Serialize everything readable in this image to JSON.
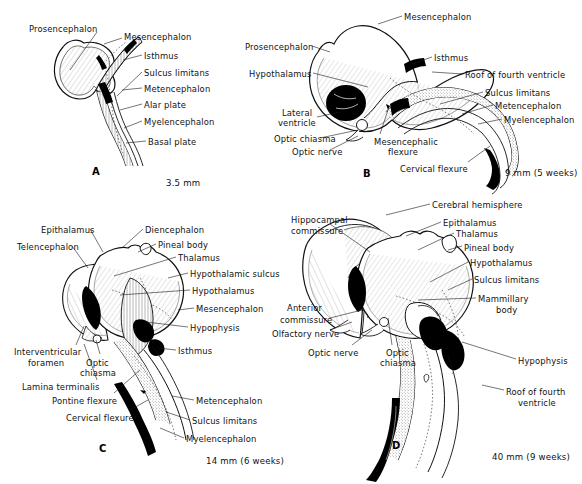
{
  "figure": {
    "background_color": "#ffffff",
    "ink_color": "#101010"
  },
  "panels": [
    {
      "letter": "A",
      "letter_pos": {
        "x": 92,
        "y": 166
      },
      "scale": "3.5 mm",
      "scale_pos": {
        "x": 166,
        "y": 178
      },
      "labels": [
        {
          "text": "Prosencephalon",
          "x": 29,
          "y": 24,
          "anchor": "start",
          "leader": [
            [
              97,
              32
            ],
            [
              70,
              70
            ]
          ]
        },
        {
          "text": "Mesencephalon",
          "x": 124,
          "y": 32,
          "anchor": "start",
          "leader": [
            [
              122,
              38
            ],
            [
              104,
              44
            ]
          ]
        },
        {
          "text": "Isthmus",
          "x": 144,
          "y": 51,
          "anchor": "start",
          "leader": [
            [
              142,
              55
            ],
            [
              123,
              60
            ]
          ]
        },
        {
          "text": "Sulcus limitans",
          "x": 144,
          "y": 68,
          "anchor": "start",
          "leader": [
            [
              142,
              72
            ],
            [
              117,
              96
            ]
          ]
        },
        {
          "text": "Metencephalon",
          "x": 144,
          "y": 84,
          "anchor": "start",
          "leader": [
            [
              142,
              88
            ],
            [
              122,
              90
            ]
          ]
        },
        {
          "text": "Alar plate",
          "x": 144,
          "y": 100,
          "anchor": "start",
          "leader": [
            [
              142,
              104
            ],
            [
              120,
              110
            ]
          ]
        },
        {
          "text": "Myelencephalon",
          "x": 144,
          "y": 117,
          "anchor": "start",
          "leader": [
            [
              142,
              121
            ],
            [
              124,
              128
            ]
          ]
        },
        {
          "text": "Basal plate",
          "x": 148,
          "y": 137,
          "anchor": "start",
          "leader": [
            [
              146,
              141
            ],
            [
              126,
              143
            ]
          ]
        }
      ]
    },
    {
      "letter": "B",
      "letter_pos": {
        "x": 363,
        "y": 168
      },
      "scale": "9 mm (5 weeks)",
      "scale_pos": {
        "x": 505,
        "y": 168
      },
      "labels": [
        {
          "text": "Mesencephalon",
          "x": 404,
          "y": 12,
          "anchor": "start",
          "leader": [
            [
              402,
              16
            ],
            [
              378,
              24
            ]
          ]
        },
        {
          "text": "Prosencephalon",
          "x": 245,
          "y": 42,
          "anchor": "start",
          "leader": [
            [
              312,
              46
            ],
            [
              330,
              52
            ]
          ]
        },
        {
          "text": "Hypothalamus",
          "x": 249,
          "y": 69,
          "anchor": "start",
          "leader": [
            [
              313,
              73
            ],
            [
              368,
              87
            ]
          ]
        },
        {
          "text": "Isthmus",
          "x": 434,
          "y": 53,
          "anchor": "start",
          "leader": [
            [
              432,
              57
            ],
            [
              412,
              64
            ]
          ]
        },
        {
          "text": "Roof of fourth ventricle",
          "x": 465,
          "y": 70,
          "anchor": "start",
          "leader": [
            [
              463,
              74
            ],
            [
              432,
              72
            ]
          ]
        },
        {
          "text": "Sulcus limitans",
          "x": 485,
          "y": 88,
          "anchor": "start",
          "leader": [
            [
              483,
              92
            ],
            [
              440,
              104
            ]
          ]
        },
        {
          "text": "Metencephalon",
          "x": 495,
          "y": 101,
          "anchor": "start",
          "leader": [
            [
              493,
              105
            ],
            [
              462,
              114
            ]
          ]
        },
        {
          "text": "Myelencephalon",
          "x": 504,
          "y": 115,
          "anchor": "start",
          "leader": [
            [
              502,
              119
            ],
            [
              478,
              124
            ]
          ]
        },
        {
          "text": "Lateral",
          "x": 282,
          "y": 108,
          "anchor": "start",
          "leader": [
            [
              317,
              117
            ],
            [
              340,
              112
            ]
          ]
        },
        {
          "text": "ventricle",
          "x": 278,
          "y": 118,
          "anchor": "start",
          "leader": null
        },
        {
          "text": "Optic chiasma",
          "x": 274,
          "y": 134,
          "anchor": "start",
          "leader": [
            [
              320,
              138
            ],
            [
              358,
              130
            ]
          ]
        },
        {
          "text": "Optic nerve",
          "x": 292,
          "y": 147,
          "anchor": "start",
          "leader": [
            [
              330,
              150
            ],
            [
              358,
              136
            ]
          ]
        },
        {
          "text": "Mesencephalic",
          "x": 374,
          "y": 137,
          "anchor": "start",
          "leader": [
            [
              380,
              134
            ],
            [
              388,
              110
            ]
          ]
        },
        {
          "text": "flexure",
          "x": 388,
          "y": 147,
          "anchor": "start",
          "leader": null
        },
        {
          "text": "Cervical flexure",
          "x": 400,
          "y": 164,
          "anchor": "start",
          "leader": [
            [
              468,
              162
            ],
            [
              490,
              146
            ]
          ]
        }
      ]
    },
    {
      "letter": "C",
      "letter_pos": {
        "x": 99,
        "y": 443
      },
      "scale": "14 mm (6 weeks)",
      "scale_pos": {
        "x": 206,
        "y": 456
      },
      "labels": [
        {
          "text": "Epithalamus",
          "x": 41,
          "y": 225,
          "anchor": "start",
          "leader": [
            [
              90,
              229
            ],
            [
              103,
              252
            ]
          ]
        },
        {
          "text": "Diencephalon",
          "x": 145,
          "y": 225,
          "anchor": "start",
          "leader": [
            [
              143,
              229
            ],
            [
              122,
              248
            ]
          ]
        },
        {
          "text": "Telencephalon",
          "x": 17,
          "y": 242,
          "anchor": "start",
          "leader": [
            [
              72,
              246
            ],
            [
              88,
              268
            ]
          ]
        },
        {
          "text": "Pineal body",
          "x": 158,
          "y": 240,
          "anchor": "start",
          "leader": [
            [
              156,
              244
            ],
            [
              138,
              252
            ]
          ]
        },
        {
          "text": "Thalamus",
          "x": 178,
          "y": 253,
          "anchor": "start",
          "leader": [
            [
              176,
              257
            ],
            [
              114,
              276
            ]
          ]
        },
        {
          "text": "Hypothalamic sulcus",
          "x": 190,
          "y": 269,
          "anchor": "start",
          "leader": [
            [
              188,
              273
            ],
            [
              168,
              278
            ]
          ]
        },
        {
          "text": "Hypothalamus",
          "x": 192,
          "y": 286,
          "anchor": "start",
          "leader": [
            [
              190,
              290
            ],
            [
              120,
              295
            ]
          ]
        },
        {
          "text": "Mesencephalon",
          "x": 196,
          "y": 304,
          "anchor": "start",
          "leader": [
            [
              194,
              308
            ],
            [
              178,
              310
            ]
          ]
        },
        {
          "text": "Hypophysis",
          "x": 190,
          "y": 323,
          "anchor": "start",
          "leader": [
            [
              188,
              327
            ],
            [
              146,
              322
            ]
          ]
        },
        {
          "text": "Isthmus",
          "x": 178,
          "y": 346,
          "anchor": "start",
          "leader": [
            [
              176,
              350
            ],
            [
              158,
              348
            ]
          ]
        },
        {
          "text": "Interventricular",
          "x": 14,
          "y": 347,
          "anchor": "start",
          "leader": [
            [
              76,
              345
            ],
            [
              84,
              326
            ]
          ]
        },
        {
          "text": "foramen",
          "x": 28,
          "y": 358,
          "anchor": "start",
          "leader": null
        },
        {
          "text": "Optic",
          "x": 86,
          "y": 358,
          "anchor": "start",
          "leader": [
            [
              100,
              354
            ],
            [
              96,
              340
            ]
          ]
        },
        {
          "text": "chiasma",
          "x": 80,
          "y": 368,
          "anchor": "start",
          "leader": null
        },
        {
          "text": "Lamina terminalis",
          "x": 22,
          "y": 382,
          "anchor": "start",
          "leader": [
            [
              97,
              380
            ],
            [
              84,
              344
            ]
          ]
        },
        {
          "text": "Pontine flexure",
          "x": 52,
          "y": 396,
          "anchor": "start",
          "leader": [
            [
              114,
              393
            ],
            [
              140,
              370
            ]
          ]
        },
        {
          "text": "Cervical flexure",
          "x": 66,
          "y": 413,
          "anchor": "start",
          "leader": [
            [
              130,
              410
            ],
            [
              148,
              400
            ]
          ]
        },
        {
          "text": "Metencephalon",
          "x": 196,
          "y": 396,
          "anchor": "start",
          "leader": [
            [
              194,
              400
            ],
            [
              172,
              396
            ]
          ]
        },
        {
          "text": "Sulcus limitans",
          "x": 192,
          "y": 416,
          "anchor": "start",
          "leader": [
            [
              190,
              420
            ],
            [
              166,
              412
            ]
          ]
        },
        {
          "text": "Myelencephalon",
          "x": 186,
          "y": 434,
          "anchor": "start",
          "leader": [
            [
              184,
              438
            ],
            [
              160,
              428
            ]
          ]
        }
      ]
    },
    {
      "letter": "D",
      "letter_pos": {
        "x": 392,
        "y": 440
      },
      "scale": "40 mm (9 weeks)",
      "scale_pos": {
        "x": 492,
        "y": 452
      },
      "labels": [
        {
          "text": "Cerebral hemisphere",
          "x": 432,
          "y": 200,
          "anchor": "start",
          "leader": [
            [
              430,
              204
            ],
            [
              386,
              215
            ]
          ]
        },
        {
          "text": "Hippocampal",
          "x": 291,
          "y": 215,
          "anchor": "start",
          "leader": [
            [
              330,
              224
            ],
            [
              370,
              252
            ]
          ]
        },
        {
          "text": "commissure",
          "x": 291,
          "y": 226,
          "anchor": "start",
          "leader": null
        },
        {
          "text": "Epithalamus",
          "x": 443,
          "y": 218,
          "anchor": "start",
          "leader": [
            [
              441,
              222
            ],
            [
              406,
              236
            ]
          ]
        },
        {
          "text": "Thalamus",
          "x": 456,
          "y": 229,
          "anchor": "start",
          "leader": [
            [
              454,
              233
            ],
            [
              418,
              250
            ]
          ]
        },
        {
          "text": "Pineal body",
          "x": 464,
          "y": 243,
          "anchor": "start",
          "leader": [
            [
              462,
              246
            ],
            [
              448,
              250
            ]
          ]
        },
        {
          "text": "Hypothalamus",
          "x": 470,
          "y": 258,
          "anchor": "start",
          "leader": [
            [
              468,
              262
            ],
            [
              430,
              282
            ]
          ]
        },
        {
          "text": "Sulcus limitans",
          "x": 474,
          "y": 275,
          "anchor": "start",
          "leader": [
            [
              472,
              279
            ],
            [
              448,
              290
            ]
          ]
        },
        {
          "text": "Mammillary",
          "x": 478,
          "y": 294,
          "anchor": "start",
          "leader": [
            [
              476,
              298
            ],
            [
              418,
              300
            ]
          ]
        },
        {
          "text": "body",
          "x": 496,
          "y": 305,
          "anchor": "start",
          "leader": null
        },
        {
          "text": "Anterior",
          "x": 287,
          "y": 303,
          "anchor": "start",
          "leader": [
            [
              330,
              318
            ],
            [
              362,
              310
            ]
          ]
        },
        {
          "text": "commissure",
          "x": 280,
          "y": 315,
          "anchor": "start",
          "leader": null
        },
        {
          "text": "Olfactory nerve",
          "x": 272,
          "y": 329,
          "anchor": "start",
          "leader": [
            [
              330,
              330
            ],
            [
              352,
              322
            ]
          ]
        },
        {
          "text": "Optic nerve",
          "x": 308,
          "y": 348,
          "anchor": "start",
          "leader": [
            [
              352,
              345
            ],
            [
              372,
              330
            ]
          ]
        },
        {
          "text": "Optic",
          "x": 386,
          "y": 348,
          "anchor": "start",
          "leader": [
            [
              392,
              345
            ],
            [
              388,
              318
            ]
          ]
        },
        {
          "text": "chiasma",
          "x": 380,
          "y": 358,
          "anchor": "start",
          "leader": null
        },
        {
          "text": "Hypophysis",
          "x": 518,
          "y": 356,
          "anchor": "start",
          "leader": [
            [
              516,
              359
            ],
            [
              462,
              342
            ]
          ]
        },
        {
          "text": "Roof of fourth",
          "x": 506,
          "y": 387,
          "anchor": "start",
          "leader": [
            [
              504,
              390
            ],
            [
              482,
              385
            ]
          ]
        },
        {
          "text": "ventricle",
          "x": 518,
          "y": 398,
          "anchor": "start",
          "leader": null
        }
      ]
    }
  ]
}
